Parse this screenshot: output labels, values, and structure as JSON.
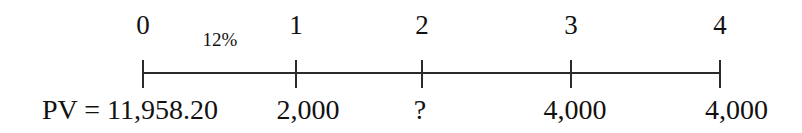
{
  "figure": {
    "type": "cash-flow-timeline",
    "axis": {
      "line_color": "#2b2b2b",
      "start_x": 143,
      "end_x": 720,
      "y": 72,
      "tick_top": 60,
      "tick_bottom": 88
    },
    "rate": {
      "label": "12%",
      "between_periods": "0-1",
      "x": 220,
      "y": 30
    },
    "periods": [
      {
        "label": "0",
        "x": 143
      },
      {
        "label": "1",
        "x": 296
      },
      {
        "label": "2",
        "x": 422
      },
      {
        "label": "3",
        "x": 571
      },
      {
        "label": "4",
        "x": 720
      }
    ],
    "cash_flows": [
      {
        "label": "PV = 11,958.20",
        "x": 42,
        "align": "left",
        "period": "0"
      },
      {
        "label": "2,000",
        "x": 308,
        "align": "center",
        "period": "1"
      },
      {
        "label": "?",
        "x": 420,
        "align": "center",
        "period": "2"
      },
      {
        "label": "4,000",
        "x": 575,
        "align": "center",
        "period": "3"
      },
      {
        "label": "4,000",
        "x": 768,
        "align": "right",
        "period": "4"
      }
    ]
  }
}
